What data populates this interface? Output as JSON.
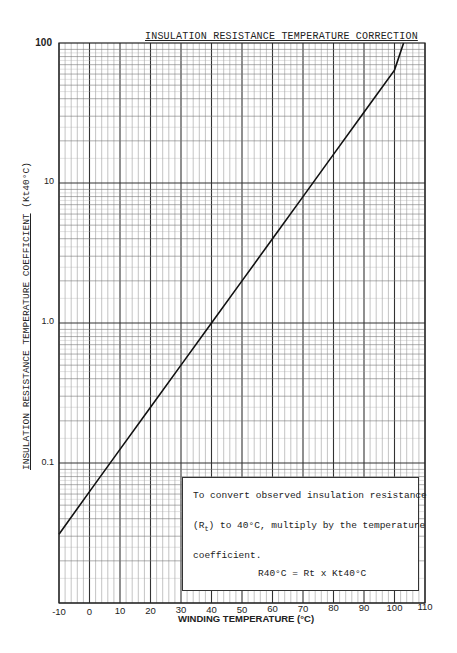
{
  "chart_data": {
    "type": "line",
    "title": "INSULATION RESISTANCE TEMPERATURE CORRECTION",
    "xlabel": "WINDING TEMPERATURE (°C)",
    "ylabel": "INSULATION RESISTANCE TEMPERATURE COEFFICIENT",
    "ylabel_suffix": "(Kt40°C)",
    "xlim": [
      -10,
      110
    ],
    "ylim": [
      0.01,
      100
    ],
    "yscale": "log",
    "grid": true,
    "x_ticks": [
      "-10",
      "0",
      "10",
      "20",
      "30",
      "40",
      "50",
      "60",
      "70",
      "80",
      "90",
      "100",
      "110"
    ],
    "y_ticks": [
      "100",
      "10",
      "1.0",
      "0.1"
    ],
    "series": [
      {
        "name": "Kt40°C",
        "x": [
          -10,
          0,
          10,
          20,
          30,
          40,
          50,
          60,
          70,
          80,
          90,
          100,
          103
        ],
        "values": [
          0.031,
          0.0625,
          0.125,
          0.25,
          0.5,
          1.0,
          2.0,
          4.0,
          8.0,
          16.0,
          32.0,
          64.0,
          100.0
        ]
      }
    ],
    "annotation": {
      "line1": "To convert observed insulation resistance",
      "line2_pre": "(R",
      "line2_sub": "t",
      "line2_post": ") to 40°C, multiply by the temperature",
      "line3": "coefficient.",
      "formula": "R40°C = Rt x Kt40°C"
    }
  }
}
